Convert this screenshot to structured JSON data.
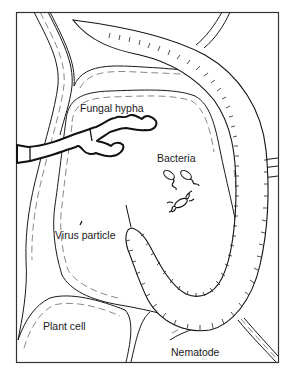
{
  "figure": {
    "type": "line-drawing illustration",
    "labels": {
      "fungal_hypha": "Fungal hypha",
      "bacteria": "Bacteria",
      "virus_particle": "Virus particle",
      "plant_cell": "Plant cell",
      "nematode": "Nematode"
    },
    "colors": {
      "line": "#1a1a1a",
      "background": "#ffffff"
    }
  }
}
